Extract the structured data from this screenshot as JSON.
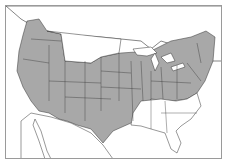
{
  "map": {
    "type": "range-map",
    "region": "North America (contiguous United States, southern Canada, northern Mexico)",
    "legend": [],
    "colors": {
      "range_fill": "#a8a8a8",
      "background": "#ffffff",
      "borders": "#333333",
      "frame": "#9a9a9a"
    },
    "shaded_range_description": "Western US (WA, OR, CA, NV, ID, UT, AZ, NM, CO), central plains, Texas, Midwest, Great Lakes region into southern Ontario/Quebec, Northeast and Mid-Atlantic; unshaded in far south-east (FL, GA, SC, AL, MS, LA) and northern plains (MT, ND)"
  }
}
